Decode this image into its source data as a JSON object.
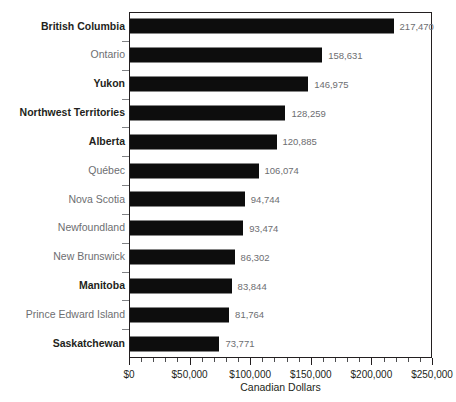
{
  "chart_data": {
    "type": "bar",
    "orientation": "horizontal",
    "title": "",
    "xlabel": "Canadian Dollars",
    "ylabel": "",
    "xlim": [
      0,
      250000
    ],
    "grid": false,
    "legend": null,
    "xticks": [
      {
        "value": 0,
        "label": "$0"
      },
      {
        "value": 50000,
        "label": "$50,000"
      },
      {
        "value": 100000,
        "label": "$100,000"
      },
      {
        "value": 150000,
        "label": "$150,000"
      },
      {
        "value": 200000,
        "label": "$200,000"
      },
      {
        "value": 250000,
        "label": "$250,000"
      }
    ],
    "minor_tick_interval": 10000,
    "bar_color": "#0d0d0d",
    "categories": [
      "British Columbia",
      "Ontario",
      "Yukon",
      "Northwest Territories",
      "Alberta",
      "Québec",
      "Nova Scotia",
      "Newfoundland",
      "New Brunswick",
      "Manitoba",
      "Prince Edward Island",
      "Saskatchewan"
    ],
    "values": [
      217470,
      158631,
      146975,
      128259,
      120885,
      106074,
      94744,
      93474,
      86302,
      83844,
      81764,
      73771
    ],
    "value_labels": [
      "217,470",
      "158,631",
      "146,975",
      "128,259",
      "120,885",
      "106,074",
      "94,744",
      "93,474",
      "86,302",
      "83,844",
      "81,764",
      "73,771"
    ],
    "emphasized": [
      true,
      false,
      true,
      true,
      true,
      false,
      false,
      false,
      false,
      true,
      false,
      true
    ],
    "bars": [
      {
        "category": "British Columbia",
        "value": 217470,
        "label": "217,470",
        "emphasized": true
      },
      {
        "category": "Ontario",
        "value": 158631,
        "label": "158,631",
        "emphasized": false
      },
      {
        "category": "Yukon",
        "value": 146975,
        "label": "146,975",
        "emphasized": true
      },
      {
        "category": "Northwest Territories",
        "value": 128259,
        "label": "128,259",
        "emphasized": true
      },
      {
        "category": "Alberta",
        "value": 120885,
        "label": "120,885",
        "emphasized": true
      },
      {
        "category": "Québec",
        "value": 106074,
        "label": "106,074",
        "emphasized": false
      },
      {
        "category": "Nova Scotia",
        "value": 94744,
        "label": "94,744",
        "emphasized": false
      },
      {
        "category": "Newfoundland",
        "value": 93474,
        "label": "93,474",
        "emphasized": false
      },
      {
        "category": "New Brunswick",
        "value": 86302,
        "label": "86,302",
        "emphasized": false
      },
      {
        "category": "Manitoba",
        "value": 83844,
        "label": "83,844",
        "emphasized": true
      },
      {
        "category": "Prince Edward Island",
        "value": 81764,
        "label": "81,764",
        "emphasized": false
      },
      {
        "category": "Saskatchewan",
        "value": 73771,
        "label": "73,771",
        "emphasized": true
      }
    ]
  }
}
